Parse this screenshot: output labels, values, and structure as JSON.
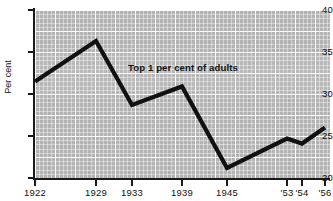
{
  "chart_data": {
    "type": "line",
    "title": "",
    "subtitle": "",
    "xlabel": "",
    "ylabel": "Per cent",
    "ylim": [
      20,
      40
    ],
    "yticks": [
      20,
      25,
      30,
      35,
      40
    ],
    "ytick_labels": [
      "20",
      "25",
      "30",
      "35",
      "40"
    ],
    "x": [
      1922,
      1929,
      1933,
      1939,
      1945,
      1953,
      1954,
      1956
    ],
    "xtick_labels": [
      "1922",
      "1929",
      "1933",
      "1939",
      "1945",
      "'53",
      "'54",
      "'56"
    ],
    "grid": true,
    "legend": "none",
    "series": [
      {
        "name": "Top 1 per cent of adults",
        "values": [
          31.5,
          36.3,
          28.7,
          30.9,
          21.2,
          24.7,
          24.1,
          26.0
        ]
      }
    ],
    "annotations": [
      {
        "text": "Top 1 per cent of adults",
        "x": 1935,
        "y": 33.3
      }
    ],
    "colors": {
      "plot_background": "#b3b3b3",
      "grid": "#ffffff",
      "series_line": "#111111",
      "axis": "#1a1a1a",
      "text": "#111111",
      "page_background": "#ffffff"
    }
  },
  "axis": {
    "y_label": "Per cent",
    "y_ticks": [
      {
        "label": "40",
        "value": 40
      },
      {
        "label": "35",
        "value": 35
      },
      {
        "label": "30",
        "value": 30
      },
      {
        "label": "25",
        "value": 25
      },
      {
        "label": "20",
        "value": 20
      }
    ],
    "x_ticks": [
      {
        "label": "1922",
        "value": 1922
      },
      {
        "label": "1929",
        "value": 1929
      },
      {
        "label": "1933",
        "value": 1933
      },
      {
        "label": "1939",
        "value": 1939
      },
      {
        "label": "1945",
        "value": 1945
      },
      {
        "label": "'53",
        "value": 1953
      },
      {
        "label": "'54",
        "value": 1954
      },
      {
        "label": "'56",
        "value": 1956
      }
    ]
  },
  "annotation": {
    "series_label": "Top 1 per cent of adults"
  }
}
